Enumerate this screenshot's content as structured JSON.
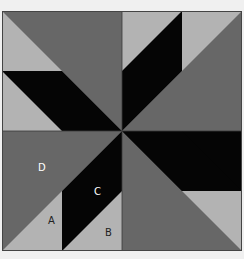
{
  "diagram": {
    "colors": {
      "light": "#b3b3b3",
      "dark": "#676767",
      "black": "#050505",
      "border": "#444444",
      "background": "#f0f0f0"
    },
    "labels": {
      "a": "A",
      "b": "B",
      "c": "C",
      "d": "D"
    }
  }
}
